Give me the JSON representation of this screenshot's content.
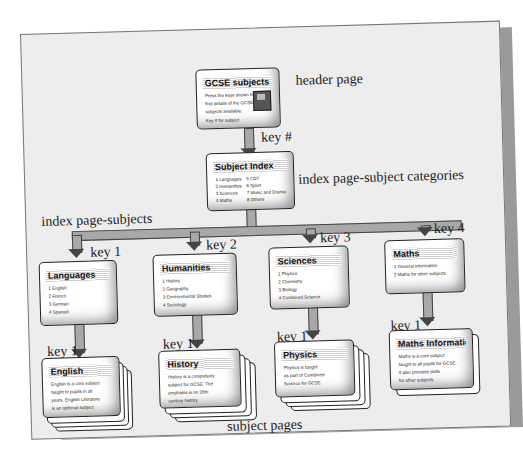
{
  "labels": {
    "header_page": "header page",
    "key_hash": "key #",
    "index_categories": "index page-subject categories",
    "index_subjects": "index page-subjects",
    "subject_pages": "subject pages",
    "key1": "key 1",
    "key2": "key 2",
    "key3": "key 3",
    "key4": "key 4"
  },
  "header_card": {
    "title": "GCSE subjects",
    "lines": [
      "Press the keys shown to",
      "find details of the GCSE",
      "subjects available.",
      "Key # for subject"
    ],
    "icon": "floppy-disk-icon"
  },
  "index_card": {
    "title": "Subject Index",
    "col1": [
      "1 Languages",
      "2 Humanities",
      "3 Sciences",
      "4 Maths"
    ],
    "col2": [
      "5 CDT",
      "6 Sport",
      "7 Music and Drama",
      "8 Others"
    ]
  },
  "category_cards": [
    {
      "title": "Languages",
      "lines": [
        "1 English",
        "2 French",
        "3 German",
        "4 Spanish"
      ]
    },
    {
      "title": "Humanities",
      "lines": [
        "1 History",
        "2 Geography",
        "3 Environmental Studies",
        "4 Sociology"
      ]
    },
    {
      "title": "Sciences",
      "lines": [
        "1 Physics",
        "2 Chemistry",
        "3 Biology",
        "4 Combined Science"
      ]
    },
    {
      "title": "Maths",
      "lines": [
        "1 General information",
        "2 Maths for other subjects"
      ]
    }
  ],
  "subject_cards": [
    {
      "title": "English",
      "lines": [
        "English is a core subject",
        "taught to pupils in all",
        "years. English Literature",
        "is an optional subject"
      ]
    },
    {
      "title": "History",
      "lines": [
        "History is a compulsory",
        "subject for GCSE. The",
        "emphasis is on 20th",
        "century history"
      ]
    },
    {
      "title": "Physics",
      "lines": [
        "Physics is taught",
        "as part of Combined",
        "Science for GCSE."
      ]
    },
    {
      "title": "Maths Information",
      "lines": [
        "Maths is a core subject",
        "taught to all pupils for GCSE.",
        "It also provides skills",
        "for other subjects"
      ]
    }
  ]
}
